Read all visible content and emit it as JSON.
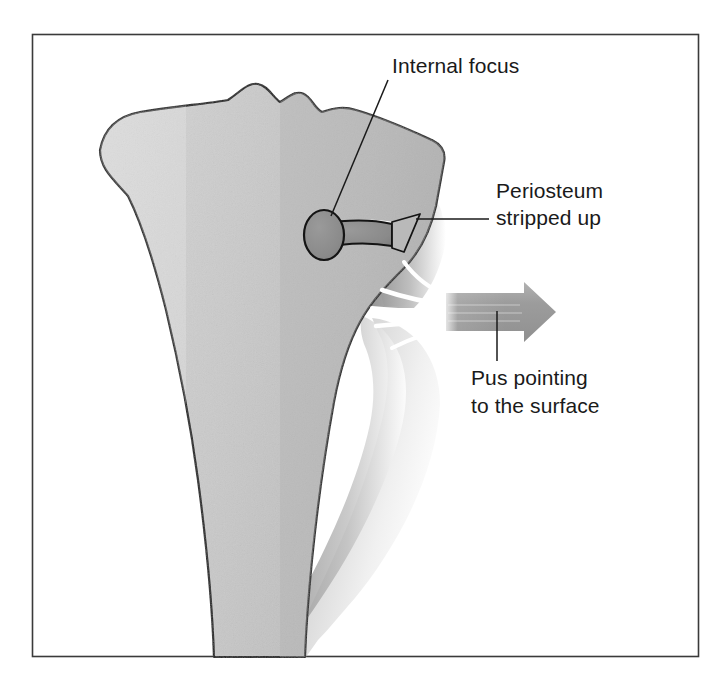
{
  "figure": {
    "frame": {
      "border_color": "#3a3a3a",
      "background_color": "#ffffff",
      "x": 32,
      "y": 34,
      "width": 667,
      "height": 623
    },
    "colors": {
      "bone_fill": "#c9c9c9",
      "bone_outline": "#1a1a1a",
      "abscess_fill": "#8c8c8c",
      "periosteum_dark": "#8a8a8a",
      "periosteum_light": "#fdfdfd",
      "arrow_fill": "#9a9a9a",
      "label_color": "#1a1a1a",
      "leader_line_color": "#1a1a1a",
      "pus_streak_color": "#ffffff"
    }
  },
  "labels": [
    {
      "id": "internal-focus",
      "lines": [
        "Internal focus"
      ],
      "text_x": 392,
      "text_y": 73,
      "leader": {
        "x1": 388,
        "y1": 80,
        "x2": 331,
        "y2": 216
      }
    },
    {
      "id": "periosteum-stripped-up",
      "lines": [
        "Periosteum",
        "stripped up"
      ],
      "text_x": 496,
      "text_y": 198,
      "line_height": 27,
      "leader": {
        "x1": 489,
        "y1": 219,
        "x2": 416,
        "y2": 219
      }
    },
    {
      "id": "pus-pointing-to-the-surface",
      "lines": [
        "Pus pointing",
        "to the surface"
      ],
      "text_x": 471,
      "text_y": 385,
      "line_height": 28,
      "leader": {
        "x1": 497,
        "y1": 311,
        "x2": 497,
        "y2": 361
      }
    }
  ],
  "anatomy": {
    "bone": {
      "name": "proximal-tibia",
      "description": "Proximal tibia shown in coronal section with bumpy condylar plateau at top, flaring metaphysis and tapering diaphyseal shaft running off the bottom of the frame."
    },
    "internal_focus": {
      "name": "intraosseous-abscess",
      "description": "Dark grey oval abscess cavity in the metaphysis with a narrow tract draining laterally to the bone cortex.",
      "cavity": {
        "cx": 324,
        "cy": 235,
        "rx": 19,
        "ry": 24
      },
      "tract": {
        "x": 336,
        "y": 227,
        "width": 58,
        "height": 19
      }
    },
    "periosteum": {
      "name": "stripped-periosteum",
      "description": "Periosteum elevated off the cortex forming a lens-shaped subperiosteal space filled with pus, bulging laterally."
    },
    "pus_arrow": {
      "name": "pus-direction-arrow",
      "description": "Broad grey arrow directed to the right indicating pus tracking out through the periosteum toward the skin surface.",
      "shaft": {
        "x": 446,
        "y": 293,
        "width": 80,
        "height": 38
      },
      "head": {
        "tip_x": 556,
        "top_y": 282,
        "bottom_y": 342
      }
    },
    "pus_streaks": {
      "name": "pus-flow-streaks",
      "count": 5,
      "description": "White flow lines converging from the subperiosteal space into the arrow shaft."
    }
  }
}
